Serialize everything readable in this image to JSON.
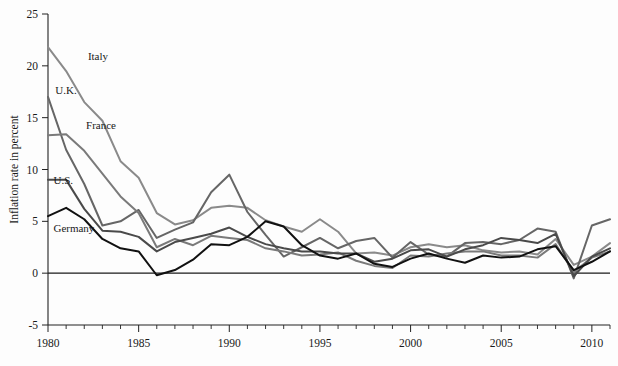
{
  "chart_data": {
    "type": "line",
    "title": "",
    "subtitle": "",
    "xlabel": "",
    "ylabel": "Inflation rate in percent",
    "xlim": [
      1980,
      2011
    ],
    "ylim": [
      -5,
      25
    ],
    "ytick_values": [
      25,
      20,
      15,
      10,
      5,
      0,
      -5
    ],
    "ytick_labels": [
      "25",
      "20",
      "15",
      "10",
      "5",
      "0",
      "-5"
    ],
    "xtick_values": [
      1980,
      1985,
      1990,
      1995,
      2000,
      2005,
      2010
    ],
    "xtick_labels": [
      "1980",
      "1985",
      "1990",
      "1995",
      "2000",
      "2005",
      "2010"
    ],
    "x_minor_step": 1,
    "grid": false,
    "legend_position": "inline-annotations",
    "zero_line": 0,
    "x": [
      1980,
      1981,
      1982,
      1983,
      1984,
      1985,
      1986,
      1987,
      1988,
      1989,
      1990,
      1991,
      1992,
      1993,
      1994,
      1995,
      1996,
      1997,
      1998,
      1999,
      2000,
      2001,
      2002,
      2003,
      2004,
      2005,
      2006,
      2007,
      2008,
      2009,
      2010,
      2011
    ],
    "series": [
      {
        "name": "Italy",
        "color": "#8a8a8a",
        "label_x": 1982.2,
        "label_y": 20.6,
        "values": [
          21.8,
          19.5,
          16.5,
          14.7,
          10.8,
          9.2,
          5.8,
          4.7,
          5.1,
          6.3,
          6.5,
          6.3,
          5.1,
          4.5,
          4.0,
          5.2,
          4.0,
          1.9,
          2.0,
          1.7,
          2.5,
          2.8,
          2.5,
          2.7,
          2.2,
          2.0,
          2.1,
          1.8,
          3.3,
          0.8,
          1.6,
          2.9
        ]
      },
      {
        "name": "U.K.",
        "color": "#666666",
        "label_x": 1980.4,
        "label_y": 17.3,
        "values": [
          17.0,
          11.9,
          8.6,
          4.6,
          5.0,
          6.1,
          3.4,
          4.2,
          4.9,
          7.8,
          9.5,
          5.9,
          3.7,
          1.6,
          2.5,
          3.4,
          2.4,
          3.1,
          3.4,
          1.5,
          3.0,
          1.8,
          1.6,
          2.9,
          3.0,
          2.8,
          3.2,
          4.3,
          4.0,
          -0.5,
          4.6,
          5.2
        ]
      },
      {
        "name": "France",
        "color": "#7a7a7a",
        "label_x": 1982.1,
        "label_y": 13.9,
        "values": [
          13.3,
          13.4,
          11.8,
          9.6,
          7.4,
          5.8,
          2.5,
          3.3,
          2.7,
          3.6,
          3.4,
          3.2,
          2.4,
          2.1,
          1.7,
          1.8,
          2.0,
          1.2,
          0.7,
          0.5,
          1.7,
          1.6,
          1.9,
          2.1,
          2.1,
          1.7,
          1.7,
          1.5,
          2.8,
          0.1,
          1.5,
          2.1
        ]
      },
      {
        "name": "U.S.",
        "color": "#4a4a4a",
        "label_x": 1980.3,
        "label_y": 8.6,
        "values": [
          9.0,
          9.0,
          6.2,
          4.1,
          4.0,
          3.5,
          2.1,
          3.0,
          3.4,
          3.8,
          4.4,
          3.5,
          2.8,
          2.4,
          2.1,
          2.1,
          1.9,
          1.9,
          1.1,
          1.4,
          2.2,
          2.3,
          1.6,
          2.3,
          2.7,
          3.4,
          3.2,
          2.9,
          3.8,
          -0.3,
          1.6,
          2.4
        ]
      },
      {
        "name": "Germany",
        "color": "#111111",
        "label_x": 1980.3,
        "label_y": 4.0,
        "values": [
          5.5,
          6.3,
          5.2,
          3.3,
          2.4,
          2.1,
          -0.2,
          0.3,
          1.3,
          2.8,
          2.7,
          3.5,
          5.0,
          4.5,
          2.7,
          1.7,
          1.4,
          1.9,
          0.9,
          0.6,
          1.4,
          1.9,
          1.4,
          1.0,
          1.7,
          1.5,
          1.6,
          2.3,
          2.6,
          0.3,
          1.1,
          2.1
        ]
      }
    ]
  }
}
